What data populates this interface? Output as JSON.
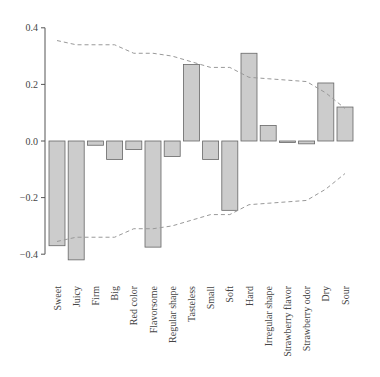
{
  "chart_data": {
    "type": "bar",
    "title": "",
    "xlabel": "",
    "ylabel": "",
    "ylim": [
      -0.45,
      0.42
    ],
    "yticks": [
      0.4,
      0.2,
      0.0,
      -0.2,
      -0.4
    ],
    "ytick_labels": [
      "0.4",
      "0.2",
      "0.0",
      "−0.2",
      "−0.4"
    ],
    "grid": false,
    "legend": null,
    "categories": [
      "Sweet",
      "Juicy",
      "Firm",
      "Big",
      "Red color",
      "Flavorsome",
      "Regular shape",
      "Tasteless",
      "Small",
      "Soft",
      "Hard",
      "Irregular shape",
      "Strawberry flavor",
      "Strawberry odor",
      "Dry",
      "Sour"
    ],
    "values": [
      -0.37,
      -0.42,
      -0.015,
      -0.065,
      -0.03,
      -0.375,
      -0.055,
      0.27,
      -0.065,
      -0.245,
      0.31,
      0.055,
      -0.005,
      -0.01,
      0.205,
      0.12
    ],
    "series": [
      {
        "name": "bars",
        "values": [
          -0.37,
          -0.42,
          -0.015,
          -0.065,
          -0.03,
          -0.375,
          -0.055,
          0.27,
          -0.065,
          -0.245,
          0.31,
          0.055,
          -0.005,
          -0.01,
          0.205,
          0.12
        ]
      },
      {
        "name": "upper dashed bound",
        "style": "dashed",
        "values": [
          0.355,
          0.34,
          0.34,
          0.34,
          0.31,
          0.31,
          0.3,
          0.28,
          0.26,
          0.26,
          0.225,
          0.22,
          0.215,
          0.21,
          0.17,
          0.115
        ]
      },
      {
        "name": "lower dashed bound",
        "style": "dashed",
        "values": [
          -0.355,
          -0.34,
          -0.34,
          -0.34,
          -0.31,
          -0.31,
          -0.3,
          -0.28,
          -0.26,
          -0.26,
          -0.225,
          -0.22,
          -0.215,
          -0.21,
          -0.17,
          -0.115
        ]
      }
    ],
    "colors": {
      "bar_fill": "#cccccc",
      "bar_stroke": "#666666",
      "dashed_line": "#999999",
      "axis": "#555555"
    }
  }
}
